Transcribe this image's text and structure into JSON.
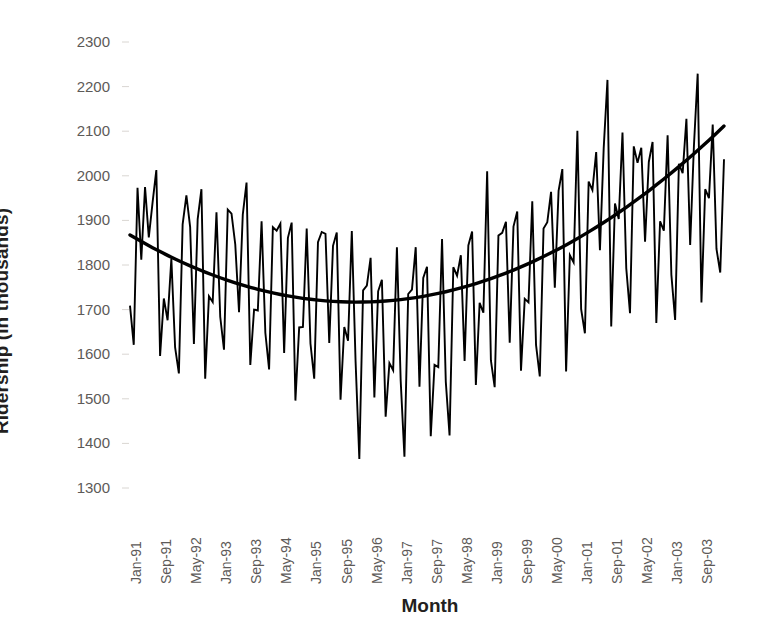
{
  "chart_data": {
    "type": "line",
    "title": "",
    "xlabel": "Month",
    "ylabel": "Ridership (in thousands)",
    "ylim": [
      1300,
      2300
    ],
    "ytick_step": 100,
    "yticks": [
      2300,
      2200,
      2100,
      2000,
      1900,
      1800,
      1700,
      1600,
      1500,
      1400,
      1300
    ],
    "grid": false,
    "legend": "none",
    "x_tick_interval_months": 8,
    "xticks": [
      "Jan-91",
      "Sep-91",
      "May-92",
      "Jan-93",
      "Sep-93",
      "May-94",
      "Jan-95",
      "Sep-95",
      "May-96",
      "Jan-97",
      "Sep-97",
      "May-98",
      "Jan-99",
      "Sep-99",
      "May-00",
      "Jan-01",
      "Sep-01",
      "May-02",
      "Jan-03",
      "Sep-03"
    ],
    "x_start": "Jan-91",
    "x_end": "Mar-04",
    "n_points": 159,
    "series": [
      {
        "name": "Ridership",
        "style": "jagged monthly line",
        "color": "#000000",
        "values": [
          1709,
          1621,
          1973,
          1812,
          1975,
          1862,
          1940,
          2013,
          1596,
          1725,
          1676,
          1814,
          1615,
          1557,
          1891,
          1956,
          1885,
          1623,
          1903,
          1970,
          1545,
          1730,
          1717,
          1918,
          1684,
          1610,
          1924,
          1915,
          1846,
          1694,
          1913,
          1985,
          1576,
          1700,
          1698,
          1898,
          1648,
          1566,
          1885,
          1877,
          1893,
          1603,
          1861,
          1895,
          1496,
          1660,
          1661,
          1882,
          1624,
          1545,
          1851,
          1874,
          1870,
          1625,
          1843,
          1873,
          1498,
          1661,
          1630,
          1876,
          1584,
          1365,
          1743,
          1754,
          1816,
          1503,
          1741,
          1767,
          1460,
          1580,
          1564,
          1840,
          1541,
          1370,
          1735,
          1745,
          1840,
          1527,
          1771,
          1796,
          1416,
          1576,
          1571,
          1858,
          1538,
          1418,
          1795,
          1776,
          1822,
          1585,
          1844,
          1875,
          1531,
          1715,
          1693,
          2010,
          1586,
          1526,
          1866,
          1872,
          1897,
          1626,
          1886,
          1920,
          1563,
          1724,
          1716,
          1943,
          1621,
          1550,
          1882,
          1896,
          1964,
          1749,
          1966,
          2015,
          1561,
          1822,
          1806,
          2101,
          1701,
          1647,
          1987,
          1968,
          2053,
          1833,
          2062,
          2215,
          1662,
          1938,
          1903,
          2097,
          1793,
          1692,
          2066,
          2029,
          2063,
          1852,
          2031,
          2076,
          1670,
          1898,
          1877,
          2091,
          1778,
          1677,
          2027,
          2006,
          2128,
          1845,
          2067,
          2229,
          1716,
          1970,
          1950,
          2115,
          1836,
          1783,
          2037
        ]
      },
      {
        "name": "Trend (polynomial order 2)",
        "style": "smooth thick curve",
        "color": "#000000",
        "anchor_points": [
          {
            "x": "Jan-91",
            "y": 1845
          },
          {
            "x": "Jan-93",
            "y": 1790
          },
          {
            "x": "Jan-95",
            "y": 1745
          },
          {
            "x": "Jan-96",
            "y": 1727
          },
          {
            "x": "Jan-97",
            "y": 1722
          },
          {
            "x": "Jan-98",
            "y": 1732
          },
          {
            "x": "Jan-99",
            "y": 1757
          },
          {
            "x": "Jan-00",
            "y": 1800
          },
          {
            "x": "Jan-01",
            "y": 1855
          },
          {
            "x": "Jan-02",
            "y": 1925
          },
          {
            "x": "Jan-03",
            "y": 2010
          },
          {
            "x": "Mar-04",
            "y": 2125
          }
        ]
      }
    ]
  }
}
